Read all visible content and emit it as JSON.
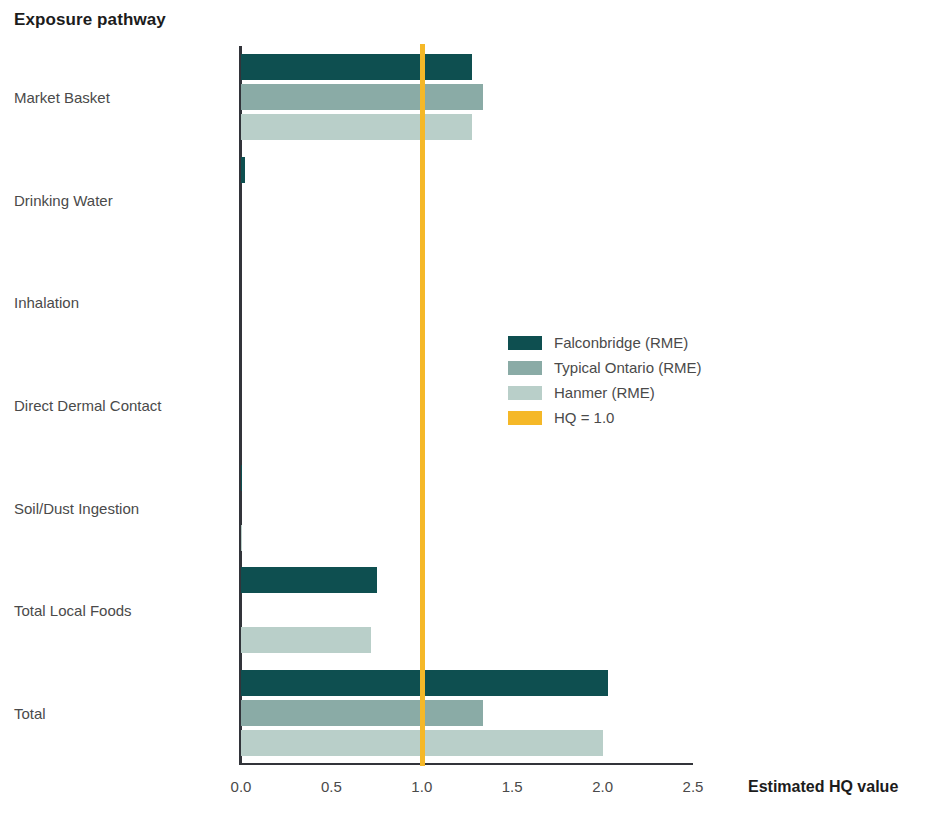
{
  "chart_data": {
    "type": "bar",
    "orientation": "horizontal",
    "title": "Exposure pathway",
    "xlabel": "Estimated HQ value",
    "ylabel": "Exposure pathway",
    "xlim": [
      0.0,
      2.5
    ],
    "xticks": [
      "0.0",
      "0.5",
      "1.0",
      "1.5",
      "2.0",
      "2.5"
    ],
    "xtick_values": [
      0.0,
      0.5,
      1.0,
      1.5,
      2.0,
      2.5
    ],
    "grid": false,
    "legend_position": "center-right",
    "categories": [
      "Market Basket",
      "Drinking Water",
      "Inhalation",
      "Direct Dermal Contact",
      "Soil/Dust Ingestion",
      "Total Local Foods",
      "Total"
    ],
    "series": [
      {
        "name": "Falconbridge (RME)",
        "color": "#0e4f50",
        "values": [
          1.28,
          0.02,
          0.0,
          0.0,
          0.005,
          0.75,
          2.03
        ]
      },
      {
        "name": "Typical Ontario (RME)",
        "color": "#8aaba6",
        "values": [
          1.34,
          0.0,
          0.0,
          0.0,
          0.0,
          0.0,
          1.34
        ]
      },
      {
        "name": "Hanmer (RME)",
        "color": "#b9cfc9",
        "values": [
          1.28,
          0.0,
          0.0,
          0.0,
          0.004,
          0.72,
          2.0
        ]
      }
    ],
    "reference_line": {
      "label": "HQ = 1.0",
      "value": 1.0,
      "color": "#f5b828"
    }
  },
  "legend": {
    "items": [
      {
        "label": "Falconbridge (RME)",
        "color": "#0e4f50"
      },
      {
        "label": "Typical Ontario (RME)",
        "color": "#8aaba6"
      },
      {
        "label": "Hanmer (RME)",
        "color": "#b9cfc9"
      },
      {
        "label": "HQ = 1.0",
        "color": "#f5b828"
      }
    ]
  }
}
